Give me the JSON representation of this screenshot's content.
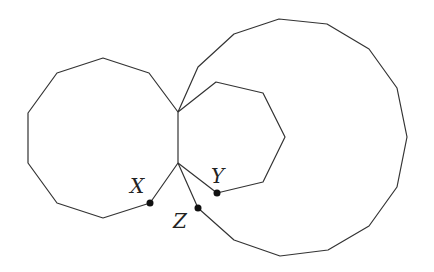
{
  "diagram": {
    "points": [
      {
        "name": "X",
        "label": "X"
      },
      {
        "name": "Y",
        "label": "Y"
      },
      {
        "name": "Z",
        "label": "Z"
      }
    ],
    "shapes": [
      {
        "name": "left-decagon",
        "sides": 10
      },
      {
        "name": "middle-heptagon",
        "sides": 7
      },
      {
        "name": "large-polygon",
        "sides": 15
      }
    ]
  }
}
